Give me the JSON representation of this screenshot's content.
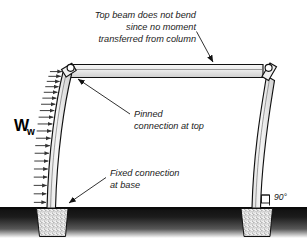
{
  "figure": {
    "title_hidden": "",
    "background_color": "#ffffff",
    "ink_color": "#111111"
  },
  "annotations": {
    "top_note": {
      "name": "top-beam-note",
      "lines": [
        "Top beam does not bend",
        "since no moment",
        "transferred from column"
      ],
      "points_to": "top-beam"
    },
    "pinned_note": {
      "name": "pinned-connection-note",
      "lines": [
        "Pinned",
        "connection at top"
      ],
      "points_to": "left-pin-connection"
    },
    "fixed_note": {
      "name": "fixed-connection-note",
      "lines": [
        "Fixed connection",
        "at base"
      ],
      "points_to": "left-footing"
    },
    "angle_note": {
      "name": "right-angle-note",
      "text": "90°",
      "points_to": "right-column-base"
    }
  },
  "load": {
    "symbol": "W",
    "subscript": "w",
    "description_hidden": "",
    "arrow_count": 20,
    "direction": "right"
  },
  "members": {
    "beam": {
      "label": "top-beam",
      "fill_top": "#f4f4f4",
      "fill_bottom": "#d2d2d2"
    },
    "left_column": {
      "label": "left-column",
      "fill_top": "#f2f2f2",
      "fill_bottom": "#cfcfcf"
    },
    "right_column": {
      "label": "right-column",
      "fill_top": "#f2f2f2",
      "fill_bottom": "#cfcfcf"
    }
  },
  "foundation": {
    "ground_color": "#1d1d1d",
    "footing_fill": "#ededed",
    "footing_speckle": "#7d7d7d",
    "left_footing_label": "left-footing",
    "right_footing_label": "right-footing"
  }
}
